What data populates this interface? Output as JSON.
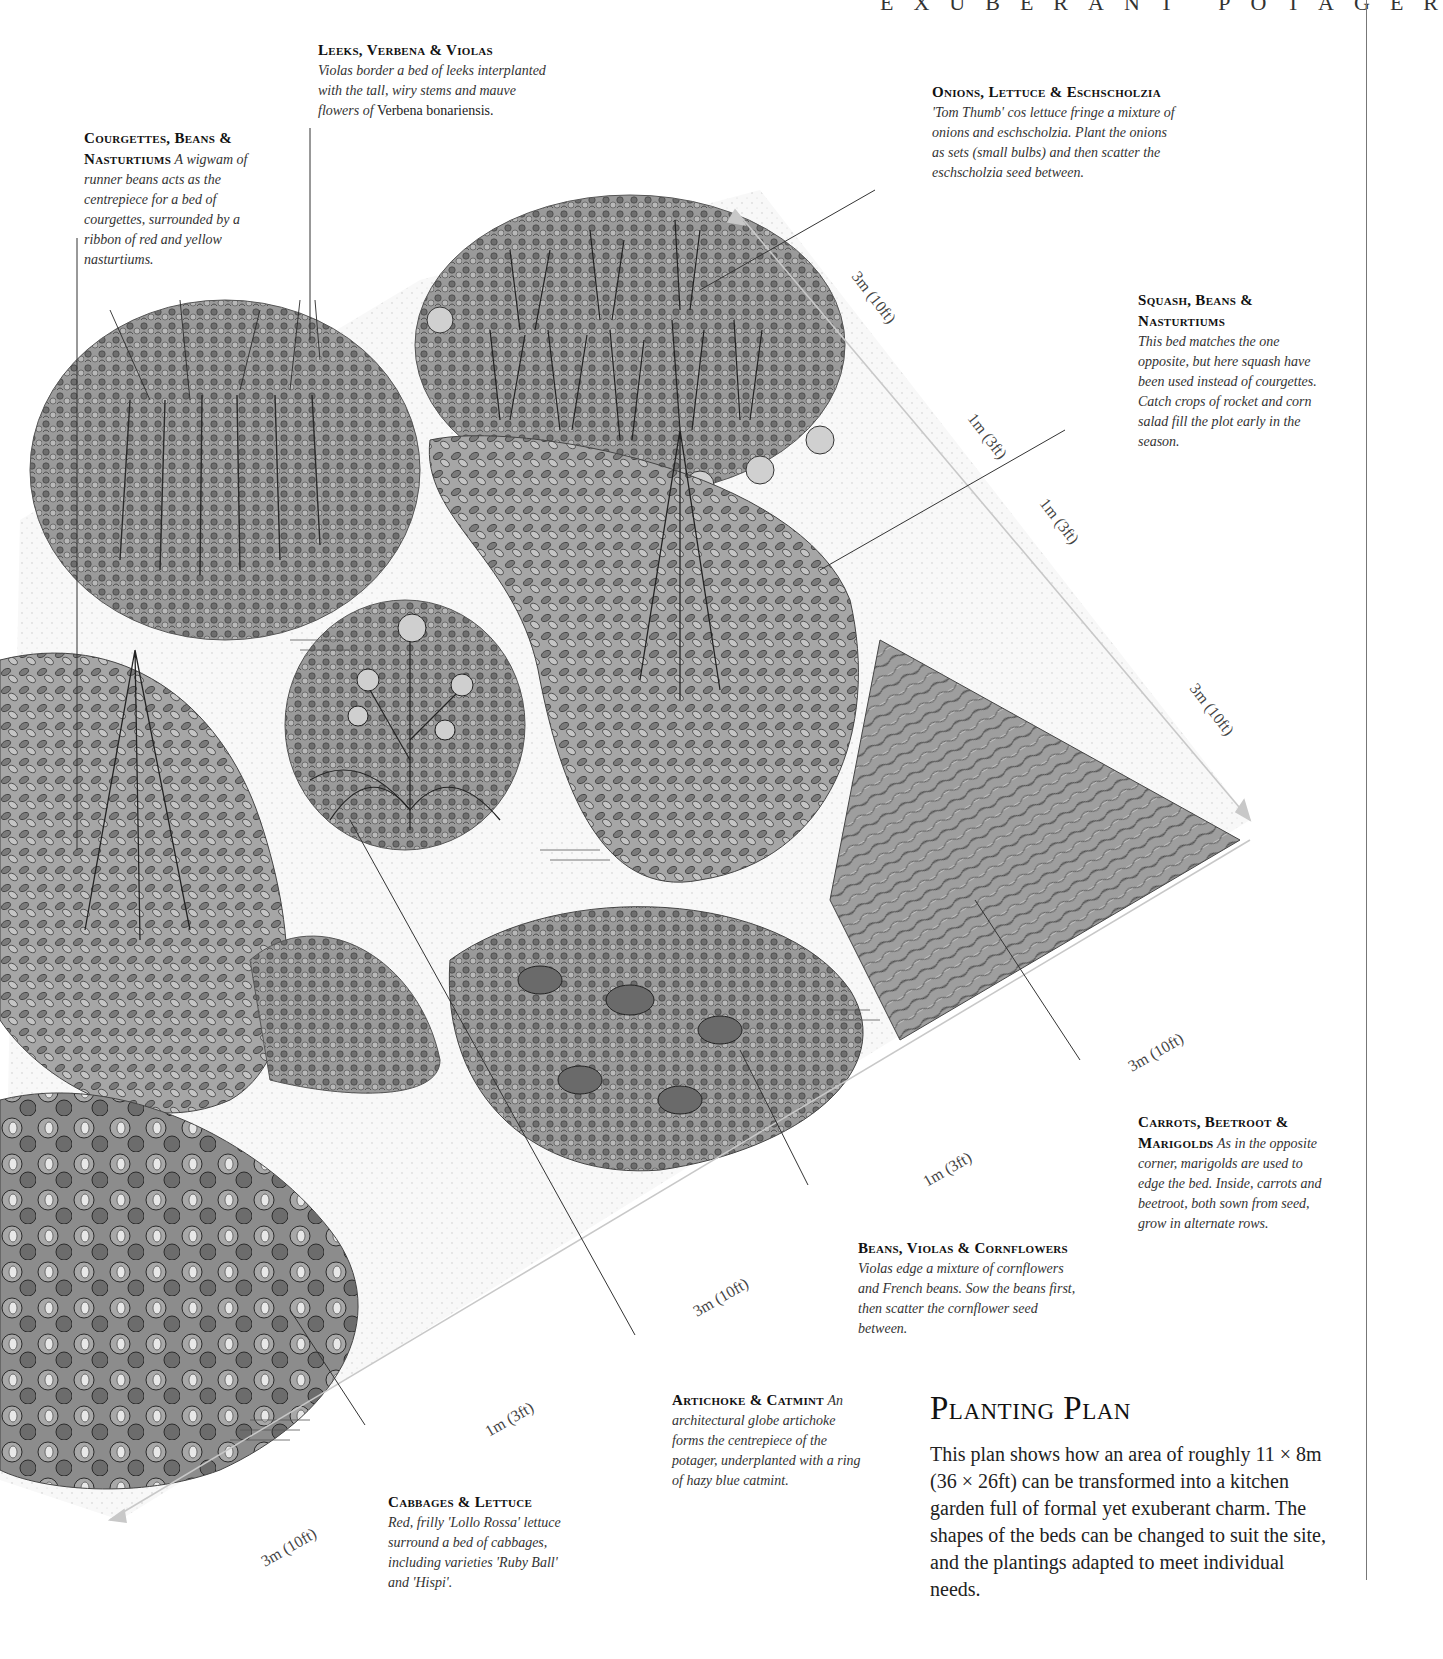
{
  "header": {
    "running_title": "EXUBERANT POTAGER"
  },
  "labels": {
    "courgettes": {
      "title": "Courgettes, Beans & Nasturtiums",
      "desc": "A wigwam of runner beans acts as the centrepiece for a bed of courgettes, surrounded by a ribbon of red and yellow nasturtiums."
    },
    "leeks": {
      "title": "Leeks, Verbena & Violas",
      "desc": "Violas border a bed of leeks interplanted with the tall, wiry stems and mauve flowers of",
      "desc_roman": "Verbena bonariensis."
    },
    "onions": {
      "title": "Onions, Lettuce & Eschscholzia",
      "desc": "'Tom Thumb' cos lettuce fringe a mixture of onions and eschscholzia. Plant the onions as sets (small bulbs) and then scatter the eschscholzia seed between."
    },
    "squash": {
      "title": "Squash, Beans & Nasturtiums",
      "desc": "This bed matches the one opposite, but here squash have been used instead of courgettes. Catch crops of rocket and corn salad fill the plot early in the season."
    },
    "carrots": {
      "title": "Carrots, Beetroot & Marigolds",
      "desc": "As in the opposite corner, marigolds are used to edge the bed. Inside, carrots and beetroot, both sown from seed, grow in alternate rows."
    },
    "beans": {
      "title": "Beans, Violas & Cornflowers",
      "desc": "Violas edge a mixture of cornflowers and French beans. Sow the beans first, then scatter the cornflower seed between."
    },
    "artichoke": {
      "title": "Artichoke & Catmint",
      "desc": "An architectural globe artichoke forms the centrepiece of the potager, underplanted with a ring of hazy blue catmint."
    },
    "cabbages": {
      "title": "Cabbages & Lettuce",
      "desc": "Red, frilly 'Lollo Rossa' lettuce surround a bed of cabbages, including varieties 'Ruby Ball' and 'Hispi'."
    }
  },
  "dimensions": {
    "top_right_1": "3m (10ft)",
    "top_right_2": "1m (3ft)",
    "top_right_3": "1m (3ft)",
    "right_edge": "3m (10ft)",
    "bottom_1": "3m (10ft)",
    "bottom_2": "1m (3ft)",
    "bottom_3": "3m (10ft)",
    "bottom_4": "1m (3ft)",
    "bottom_5": "3m (10ft)"
  },
  "planting_plan": {
    "heading": "Planting Plan",
    "body": "This plan shows how an area of roughly 11 × 8m (36 × 26ft) can be transformed into a kitchen garden full of formal yet exuberant charm. The shapes of the beds can be changed to suit the site, and the plantings adapted to meet individual needs."
  },
  "colors": {
    "ink": "#1e1e1e",
    "dimension_line": "#c8c8c8",
    "bed_fill": "#8a8a8a",
    "path": "#f4f4f4"
  }
}
